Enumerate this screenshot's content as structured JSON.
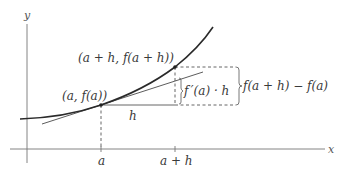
{
  "diagram": {
    "axes": {
      "x_label": "x",
      "y_label": "y"
    },
    "points": {
      "p1": {
        "label": "(a, f(a))"
      },
      "p2": {
        "label": "(a + h, f(a + h))"
      }
    },
    "ticks": {
      "a": "a",
      "a_plus_h": "a + h"
    },
    "labels": {
      "h": "h",
      "tangent_rise": "f ′(a) · h",
      "actual_rise": "f(a + h) − f(a)"
    },
    "colors": {
      "curve": "#2a2a2a",
      "tangent": "#4a4a4a",
      "axes": "#777777",
      "dashed": "#555555",
      "text": "#3a3a3a"
    }
  }
}
